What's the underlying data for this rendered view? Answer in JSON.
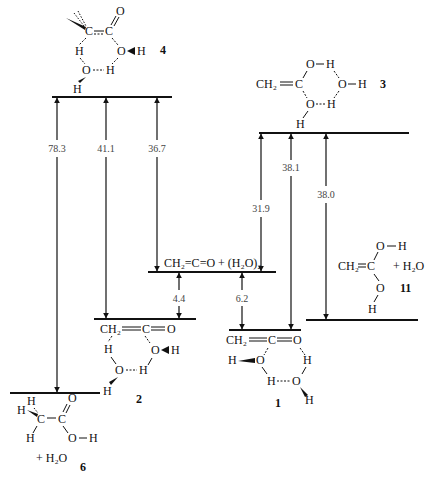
{
  "diagram": {
    "type": "energy-level-diagram",
    "levels": [
      {
        "id": "4",
        "label": "4",
        "y": 97,
        "x1": 52,
        "x2": 172
      },
      {
        "id": "3",
        "label": "3",
        "y": 133,
        "x1": 259,
        "x2": 409
      },
      {
        "id": "ketene_dimer",
        "label": "CH2=C=O + (H2O)2",
        "y": 272,
        "x1": 148,
        "x2": 276
      },
      {
        "id": "2",
        "label": "2",
        "y": 319,
        "x1": 94,
        "x2": 196
      },
      {
        "id": "11",
        "label": "11",
        "y": 320,
        "x1": 306,
        "x2": 418
      },
      {
        "id": "1",
        "label": "1",
        "y": 330,
        "x1": 229,
        "x2": 301
      },
      {
        "id": "6",
        "label": "6",
        "y": 393,
        "x1": 10,
        "x2": 100
      }
    ],
    "arrows": [
      {
        "from": "6",
        "to": "4",
        "value": "78.3"
      },
      {
        "from": "2",
        "to": "4",
        "value": "41.1"
      },
      {
        "from": "4",
        "to": "ketene_dimer",
        "value": "36.7"
      },
      {
        "from": "ketene_dimer",
        "to": "3",
        "value": "31.9"
      },
      {
        "from": "1",
        "to": "3",
        "value": "38.1"
      },
      {
        "from": "11",
        "to": "3",
        "value": "38.0"
      },
      {
        "from": "ketene_dimer",
        "to": "2",
        "value": "4.4"
      },
      {
        "from": "ketene_dimer",
        "to": "1",
        "value": "6.2"
      }
    ],
    "texts": {
      "ketene_dimer_formula": "CH₂=C=O + (H₂O)₂",
      "plus_water": "+ H₂O",
      "struct_3_ch2": "CH₂",
      "struct_11_ch2": "CH₂",
      "struct_2_ch2": "CH₂",
      "struct_1_ch2": "CH₂",
      "label_1": "1",
      "label_2": "2",
      "label_3": "3",
      "label_4": "4",
      "label_6": "6",
      "label_11": "11"
    }
  }
}
